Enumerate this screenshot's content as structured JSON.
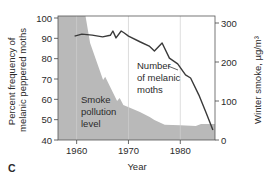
{
  "chart_data": {
    "type": "line",
    "panel_label": "C",
    "title": "",
    "xlabel": "Year",
    "ylabel_left": [
      "Percent frequency of",
      "melanic peppered moths"
    ],
    "ylabel_right": "Winter smoke, µg/m³",
    "xlim": [
      1956.4,
      1986.7
    ],
    "ylim_left": [
      40,
      100
    ],
    "ylim_right": [
      0,
      300
    ],
    "x_ticks": [
      1960,
      1970,
      1980
    ],
    "y_ticks_left": [
      40,
      50,
      60,
      70,
      80,
      90,
      100
    ],
    "y_ticks_right": [
      0,
      100,
      200,
      300
    ],
    "vertical_gridlines": [
      1960,
      1970,
      1980
    ],
    "series": [
      {
        "name": "Number of melanic moths",
        "type": "line",
        "axis": "left",
        "color": "#3a3a3a",
        "x": [
          1959.6,
          1961.0,
          1963.0,
          1965.0,
          1966.5,
          1967.0,
          1967.6,
          1968.6,
          1969.2,
          1970.0,
          1972.3,
          1974.0,
          1975.0,
          1976.5,
          1977.9,
          1979.5,
          1981.0,
          1982.0,
          1983.6,
          1985.0,
          1986.3
        ],
        "y": [
          91.1,
          92.1,
          91.6,
          90.7,
          91.5,
          93.6,
          90.2,
          93.6,
          92.6,
          91.1,
          88.2,
          86.2,
          83.8,
          87.7,
          80.3,
          77.5,
          72.0,
          70.5,
          62.1,
          53.3,
          44.9
        ]
      },
      {
        "name": "Smoke pollution level",
        "type": "area",
        "axis": "right",
        "color": "#b9b9b9",
        "x": [
          1956.4,
          1961.7,
          1962.6,
          1965.1,
          1965.5,
          1967.8,
          1968.3,
          1968.8,
          1969.0,
          1970.4,
          1972.2,
          1974.1,
          1975.0,
          1977.0,
          1980.0,
          1983.0,
          1984.0,
          1986.7
        ],
        "y": [
          318,
          318,
          249,
          154,
          162,
          100,
          108,
          95,
          90,
          82,
          72,
          59,
          51,
          39,
          38,
          36,
          41,
          41
        ]
      }
    ],
    "annotations": [
      {
        "text": [
          "Number",
          "of melanic",
          "moths"
        ],
        "target": "Number of melanic moths"
      },
      {
        "text": [
          "Smoke",
          "pollution",
          "level"
        ],
        "target": "Smoke pollution level"
      }
    ],
    "legend": "none",
    "grid": "vertical only"
  }
}
